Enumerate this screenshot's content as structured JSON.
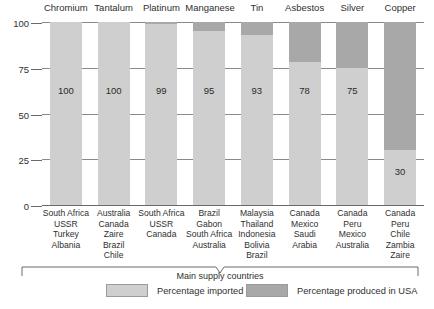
{
  "chart_data": {
    "type": "bar",
    "title": "",
    "subtitle": "",
    "xlabel": "Main supply countries",
    "ylabel": "",
    "ylim": [
      0,
      100
    ],
    "yticks": [
      0,
      25,
      50,
      75,
      100
    ],
    "ytick_labels": [
      "0",
      "25",
      "50",
      "75",
      "100"
    ],
    "grid": true,
    "stacked": true,
    "legend_position": "bottom",
    "categories": [
      "Chromium",
      "Tantalum",
      "Platinum",
      "Manganese",
      "Tin",
      "Asbestos",
      "Silver",
      "Copper"
    ],
    "series": [
      {
        "name": "Percentage imported",
        "color": "#cfcfcf",
        "values": [
          100,
          100,
          99,
          95,
          93,
          78,
          75,
          30
        ]
      },
      {
        "name": "Percentage produced in USA",
        "color": "#a8a8a8",
        "values": [
          0,
          0,
          1,
          5,
          7,
          22,
          25,
          70
        ]
      }
    ],
    "data_labels": [
      "100",
      "100",
      "99",
      "95",
      "93",
      "78",
      "75",
      "30"
    ],
    "supply_countries": [
      [
        "South Africa",
        "USSR",
        "Turkey",
        "Albania"
      ],
      [
        "Australia",
        "Canada",
        "Zaire",
        "Brazil",
        "Chile"
      ],
      [
        "South Africa",
        "USSR",
        "Canada"
      ],
      [
        "Brazil",
        "Gabon",
        "South Africa",
        "Australia"
      ],
      [
        "Malaysia",
        "Thailand",
        "Indonesia",
        "Bolivia",
        "Brazil"
      ],
      [
        "Canada",
        "Mexico",
        "Saudi",
        "Arabia"
      ],
      [
        "Canada",
        "Peru",
        "Mexico",
        "Australia"
      ],
      [
        "Canada",
        "Peru",
        "Chile",
        "Zambia",
        "Zaire"
      ]
    ]
  },
  "axis": {
    "tick_100": "100",
    "tick_75": "75",
    "tick_50": "50",
    "tick_25": "25",
    "tick_0": "0"
  },
  "caption": {
    "brace_label": "Main supply countries"
  },
  "legend": {
    "imported_label": "Percentage imported",
    "usa_label": "Percentage produced in USA",
    "imported_color": "#cfcfcf",
    "usa_color": "#a8a8a8"
  }
}
